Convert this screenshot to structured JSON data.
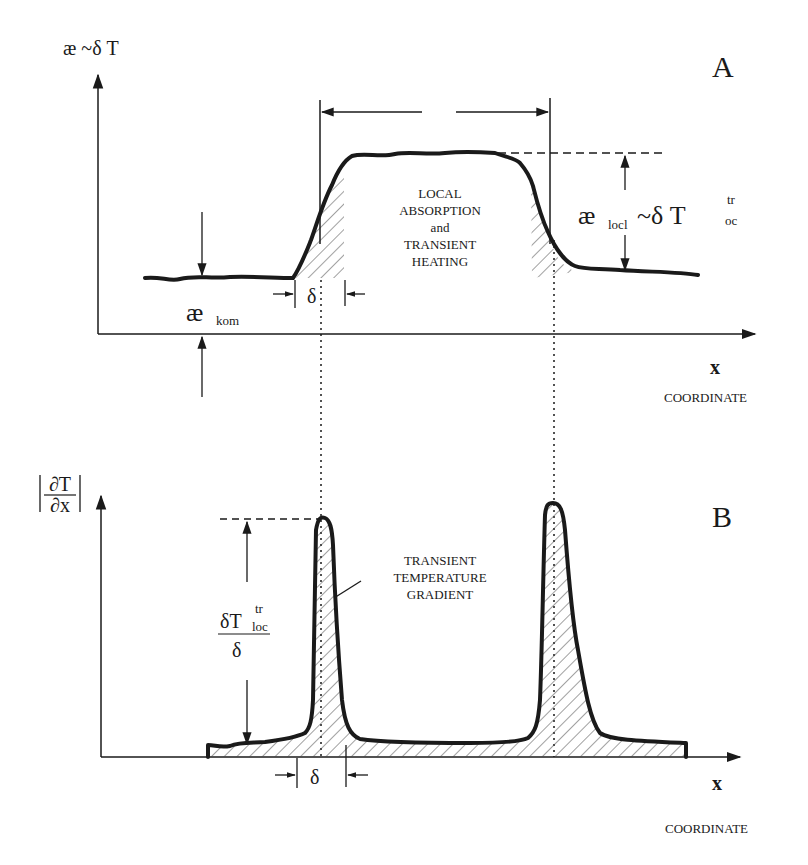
{
  "panel_a": {
    "panel_label": "A",
    "y_axis_label": "æ ~δ T",
    "x_axis_label": "x",
    "x_axis_caption": "COORDINATE",
    "region_text": [
      "LOCAL",
      "ABSORPTION",
      "and",
      "TRANSIENT",
      "HEATING"
    ],
    "baseline_label_main": "æ",
    "baseline_label_sub": "kom",
    "step_label_main": "æ",
    "step_label_sub": "locl",
    "step_label_mid": "~δ T",
    "step_label_sup": "tr",
    "step_label_sub2": "oc",
    "width_label": "δ"
  },
  "panel_b": {
    "panel_label": "B",
    "y_axis_num": "∂T",
    "y_axis_den": "∂x",
    "x_axis_label": "x",
    "x_axis_caption": "COORDINATE",
    "annotation": [
      "TRANSIENT",
      "TEMPERATURE",
      "GRADIENT"
    ],
    "height_label_num": "δT",
    "height_label_sup": "tr",
    "height_label_sub": "loc",
    "height_label_den": "δ",
    "width_label": "δ"
  },
  "colors": {
    "ink": "#1a1a1a",
    "background": "#ffffff"
  }
}
